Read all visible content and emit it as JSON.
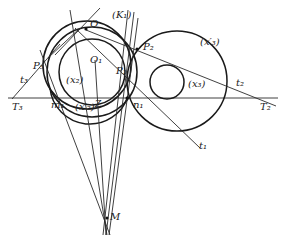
{
  "diagram": {
    "labels": {
      "K1": "(K₁)",
      "Q": "Q",
      "O1": "O₁",
      "P1": "P₁",
      "P2": "P₂",
      "P3": "P₃",
      "x2": "(x₂)",
      "x2p": "(x′₂)",
      "x3": "(x₃)",
      "x3p": "(x′₃)",
      "m1": "m₁",
      "n1": "n₁",
      "Z": "Z",
      "t1": "t₁",
      "t2": "t₂",
      "t3": "t₃",
      "T2": "T₂",
      "T3": "T₃",
      "M": "M"
    },
    "colors": {
      "stroke": "#1a1a1a",
      "background": "#ffffff"
    }
  }
}
